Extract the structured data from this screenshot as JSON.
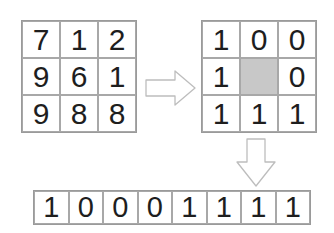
{
  "diagram": {
    "title": "",
    "input_grid": {
      "label": "",
      "cells": [
        "7",
        "1",
        "2",
        "9",
        "6",
        "1",
        "9",
        "8",
        "8"
      ]
    },
    "threshold_grid": {
      "label": "",
      "cells": [
        "1",
        "0",
        "0",
        "1",
        "",
        "0",
        "1",
        "1",
        "1"
      ],
      "center_fill": "#c8c8c8"
    },
    "binary_code": {
      "cells": [
        "1",
        "0",
        "0",
        "0",
        "1",
        "1",
        "1",
        "1"
      ]
    },
    "arrows": [
      {
        "name": "right-arrow",
        "direction": "right"
      },
      {
        "name": "down-arrow",
        "direction": "down"
      }
    ],
    "colors": {
      "border": "#a8a8a8",
      "text": "#1e1e1e",
      "arrow_stroke": "#bdbdbd",
      "arrow_fill": "#ffffff"
    }
  }
}
